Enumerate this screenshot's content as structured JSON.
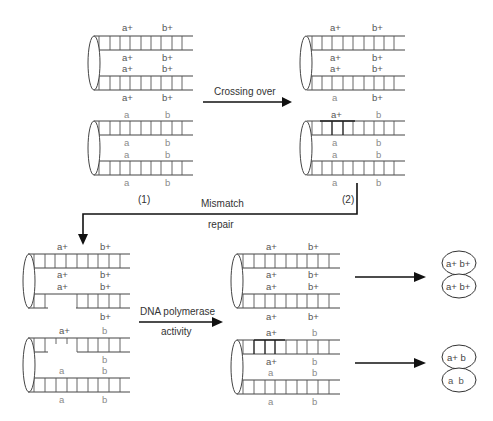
{
  "figure": {
    "type": "diagram"
  },
  "steps": {
    "crossing_over_label": "Crossing over",
    "mismatch_label_line1": "Mismatch",
    "mismatch_label_line2": "repair",
    "polymerase_label_line1": "DNA polymerase",
    "polymerase_label_line2": "activity",
    "stage1_label": "(1)",
    "stage2_label": "(2)"
  },
  "molecules": {
    "m1": {
      "chromatid_top": {
        "labels": [
          [
            "a+",
            "b+"
          ],
          [
            "a+",
            "b+"
          ],
          [
            "a+",
            "b+"
          ],
          [
            "a+",
            "b+"
          ]
        ]
      },
      "chromatid_bottom": {
        "labels": [
          [
            "a",
            "b"
          ],
          [
            "a",
            "b"
          ],
          [
            "a",
            "b"
          ],
          [
            "a",
            "b"
          ]
        ]
      }
    },
    "m2": {
      "chromatid_top": {
        "labels": [
          [
            "a+",
            "b+"
          ],
          [
            "a+",
            "b+"
          ],
          [
            "a+",
            "b+"
          ],
          [
            "a",
            "b+"
          ]
        ]
      },
      "chromatid_bottom": {
        "labels": [
          [
            "a+",
            "b"
          ],
          [
            "a",
            "b"
          ],
          [
            "a",
            "b"
          ],
          [
            "a",
            "b"
          ]
        ]
      }
    },
    "m3": {
      "chromatid_top": {
        "labels": [
          [
            "a+",
            "b+"
          ],
          [
            "a+",
            "b+"
          ],
          [
            "a+",
            "b+"
          ],
          [
            "",
            "b+"
          ]
        ]
      },
      "chromatid_bottom": {
        "labels": [
          [
            "a+",
            "b"
          ],
          [
            "",
            "b"
          ],
          [
            "a",
            "b"
          ],
          [
            "a",
            "b"
          ]
        ]
      }
    },
    "m4": {
      "chromatid_top": {
        "labels": [
          [
            "a+",
            "b+"
          ],
          [
            "a+",
            "b+"
          ],
          [
            "a+",
            "b+"
          ],
          [
            "a+",
            "b+"
          ]
        ]
      },
      "chromatid_bottom": {
        "labels": [
          [
            "a+",
            "b"
          ],
          [
            "a+",
            "b"
          ],
          [
            "a",
            "b"
          ],
          [
            "a",
            "b"
          ]
        ]
      }
    }
  },
  "products": {
    "top": {
      "cells": [
        "a+ b+",
        "a+ b+"
      ]
    },
    "bottom": {
      "cells": [
        "a+ b",
        "a  b"
      ]
    }
  },
  "labels": {
    "m1_t0a": "a+",
    "m1_t0b": "b+",
    "m1_t1a": "a+",
    "m1_t1b": "b+",
    "m1_t2a": "a+",
    "m1_t2b": "b+",
    "m1_t3a": "a+",
    "m1_t3b": "b+",
    "m1_b0a": "a",
    "m1_b0b": "b",
    "m1_b1a": "a",
    "m1_b1b": "b",
    "m1_b2a": "a",
    "m1_b2b": "b",
    "m1_b3a": "a",
    "m1_b3b": "b",
    "m2_t0a": "a+",
    "m2_t0b": "b+",
    "m2_t1a": "a+",
    "m2_t1b": "b+",
    "m2_t2a": "a+",
    "m2_t2b": "b+",
    "m2_t3a": "a",
    "m2_t3b": "b+",
    "m2_b0a": "a+",
    "m2_b0b": "b",
    "m2_b1a": "a",
    "m2_b1b": "b",
    "m2_b2a": "a",
    "m2_b2b": "b",
    "m2_b3a": "a",
    "m2_b3b": "b",
    "m3_t0a": "a+",
    "m3_t0b": "b+",
    "m3_t1a": "a+",
    "m3_t1b": "b+",
    "m3_t2a": "a+",
    "m3_t2b": "b+",
    "m3_t3b": "b+",
    "m3_b0a": "a+",
    "m3_b0b": "b",
    "m3_b1b": "b",
    "m3_b2a": "a",
    "m3_b2b": "b",
    "m3_b3a": "a",
    "m3_b3b": "b",
    "m4_t0a": "a+",
    "m4_t0b": "b+",
    "m4_t1a": "a+",
    "m4_t1b": "b+",
    "m4_t2a": "a+",
    "m4_t2b": "b+",
    "m4_t3a": "a+",
    "m4_t3b": "b+",
    "m4_b0a": "a+",
    "m4_b0b": "b",
    "m4_b1a": "a+",
    "m4_b1b": "b",
    "m4_b2a": "a",
    "m4_b2b": "b",
    "m4_b3a": "a",
    "m4_b3b": "b",
    "p_top1": "a+ b+",
    "p_top2": "a+ b+",
    "p_bot1": "a+ b",
    "p_bot2": "a  b"
  },
  "colors": {
    "line": "#444444",
    "arrow": "#111111",
    "label_wild": "#555555",
    "label_mutant": "#8a8a8a",
    "background": "#ffffff"
  }
}
